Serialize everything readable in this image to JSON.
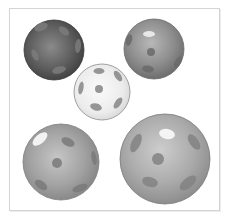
{
  "scene": {
    "description": "Five grey wiffle-style balls with oval holes on a white framed background",
    "frame": {
      "x": 9,
      "y": 8,
      "width": 211,
      "height": 203,
      "border_color": "#d4d4d4",
      "background": "#ffffff"
    },
    "balls": [
      {
        "name": "dark-ball-top-left",
        "cx": 54,
        "cy": 50,
        "r": 30,
        "light": "#8a8a8a",
        "mid": "#5e5e5e",
        "dark": "#3e3e3e",
        "stroke": "#3a3a3a",
        "hole": "#7c7c7c",
        "highlight": null
      },
      {
        "name": "grey-ball-top-right",
        "cx": 154,
        "cy": 49,
        "r": 30,
        "light": "#b8b8b8",
        "mid": "#8f8f8f",
        "dark": "#6e6e6e",
        "stroke": "#6a6a6a",
        "hole": "#6a6a6a",
        "highlight": "#e8e8e8"
      },
      {
        "name": "white-ball-center",
        "cx": 102,
        "cy": 92,
        "r": 28,
        "light": "#fafafa",
        "mid": "#ececec",
        "dark": "#d6d6d6",
        "stroke": "#8a8a8a",
        "hole": "#8c8c8c",
        "highlight": null
      },
      {
        "name": "grey-ball-bottom-left",
        "cx": 61,
        "cy": 162,
        "r": 38,
        "light": "#c6c6c6",
        "mid": "#a2a2a2",
        "dark": "#838383",
        "stroke": "#7d7d7d",
        "hole": "#7a7a7a",
        "highlight": "#f2f2f2"
      },
      {
        "name": "grey-ball-bottom-right",
        "cx": 165,
        "cy": 159,
        "r": 45,
        "light": "#cdcdcd",
        "mid": "#acacac",
        "dark": "#8e8e8e",
        "stroke": "#7a7a7a",
        "hole": "#838383",
        "highlight": "#f4f4f4"
      }
    ]
  }
}
